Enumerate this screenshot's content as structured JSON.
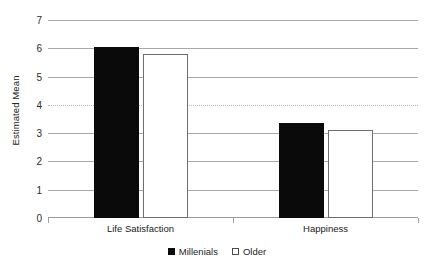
{
  "chart_data": {
    "type": "bar",
    "title": "",
    "xlabel": "",
    "ylabel": "Estimated Mean",
    "categories": [
      "Life Satisfaction",
      "Happiness"
    ],
    "series": [
      {
        "name": "Millenials",
        "values": [
          6.05,
          3.35
        ],
        "color": "#0a0a0a",
        "swatch": "filled"
      },
      {
        "name": "Older",
        "values": [
          5.8,
          3.12
        ],
        "color": "#ffffff",
        "swatch": "hollow"
      }
    ],
    "ylim": [
      0,
      7
    ],
    "yticks": [
      0,
      1,
      2,
      3,
      4,
      5,
      6,
      7
    ],
    "ytick_labels": [
      "0",
      "1",
      "2",
      "3",
      "4",
      "5",
      "6",
      "7"
    ],
    "grid": true,
    "grid_style": [
      "solid",
      "solid",
      "solid",
      "solid",
      "dotted",
      "solid",
      "solid",
      "solid"
    ],
    "legend_position": "bottom-center"
  },
  "legend": {
    "items": [
      {
        "label": "Millenials",
        "swatch": "filled"
      },
      {
        "label": "Older",
        "swatch": "hollow"
      }
    ]
  },
  "axes": {
    "y_title": "Estimated Mean"
  }
}
